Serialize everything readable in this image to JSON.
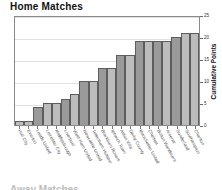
{
  "chart_data": {
    "type": "bar",
    "title": "Home Matches",
    "xlabel": "",
    "ylabel": "Cumulative Points",
    "ylim": [
      0,
      25
    ],
    "yticks": [
      0,
      5,
      10,
      15,
      20,
      25
    ],
    "grid": true,
    "legend": null,
    "categories": [
      "Hull City",
      "Everton",
      "Leeds United",
      "Leicester City",
      "Middlesbrough",
      "Liverpool",
      "West Ham United",
      "Newcastle United",
      "Tottenham Hotspur",
      "Blackburn Rovers",
      "Ipswich Town",
      "Aston Villa",
      "Derby County",
      "Manchester United",
      "Chelsea",
      "Bolton Wanderers",
      "Arsenal",
      "Sunderland",
      "Southampton",
      "Charlton"
    ],
    "values": [
      1,
      1,
      4,
      5,
      5,
      6,
      7,
      10,
      10,
      13,
      13,
      16,
      16,
      19,
      19,
      19,
      19,
      20,
      21,
      21
    ],
    "bar_shades": [
      "light",
      "light",
      "dark",
      "light",
      "light",
      "dark",
      "light",
      "dark",
      "light",
      "dark",
      "light",
      "dark",
      "light",
      "dark",
      "light",
      "dark",
      "light",
      "dark",
      "light",
      "light"
    ]
  },
  "colors": {
    "bar_dark": "#9a9a9a",
    "bar_light": "#bcbcbc",
    "bar_outline": "#5d5d5d",
    "frame": "#8a8a8a",
    "grid": "#e2e2e2",
    "text": "#111111"
  },
  "footer": {
    "next_chart_title": "Away Matches"
  }
}
